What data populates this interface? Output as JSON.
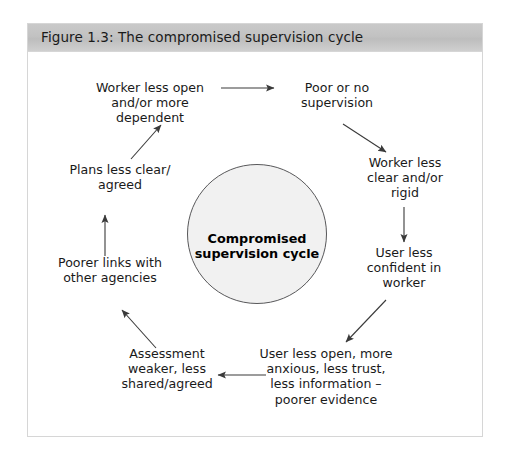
{
  "figure": {
    "title": "Figure 1.3: The compromised supervision cycle",
    "header_color": "#c4c4c4",
    "frame_border_color": "#d6d6d6",
    "background_color": "#ffffff"
  },
  "center": {
    "label": "Compromised\nsupervision cycle",
    "fill_color": "#f1f1f1",
    "border_color": "#58585a"
  },
  "nodes": [
    {
      "id": "worker-less-open",
      "label": "Worker less open\nand/or more\ndependent"
    },
    {
      "id": "poor-or-no-supervision",
      "label": "Poor or no\nsupervision"
    },
    {
      "id": "worker-less-clear",
      "label": "Worker less\nclear and/or\nrigid"
    },
    {
      "id": "user-less-confident",
      "label": "User less\nconfident in\nworker"
    },
    {
      "id": "user-less-open",
      "label": "User less open, more\nanxious, less trust,\nless information –\npoorer evidence"
    },
    {
      "id": "assessment-weaker",
      "label": "Assessment\nweaker, less\nshared/agreed"
    },
    {
      "id": "poorer-links",
      "label": "Poorer links with\nother agencies"
    },
    {
      "id": "plans-less-clear",
      "label": "Plans less clear/\nagreed"
    }
  ],
  "arrows": [
    {
      "id": "arrow-worker-open-to-poor-supervision",
      "from": "worker-less-open",
      "to": "poor-or-no-supervision"
    },
    {
      "id": "arrow-poor-supervision-to-worker-clear",
      "from": "poor-or-no-supervision",
      "to": "worker-less-clear"
    },
    {
      "id": "arrow-worker-clear-to-user-confident",
      "from": "worker-less-clear",
      "to": "user-less-confident"
    },
    {
      "id": "arrow-user-confident-to-user-open",
      "from": "user-less-confident",
      "to": "user-less-open"
    },
    {
      "id": "arrow-user-open-to-assessment",
      "from": "user-less-open",
      "to": "assessment-weaker"
    },
    {
      "id": "arrow-assessment-to-poorer-links",
      "from": "assessment-weaker",
      "to": "poorer-links"
    },
    {
      "id": "arrow-poorer-links-to-plans",
      "from": "poorer-links",
      "to": "plans-less-clear"
    },
    {
      "id": "arrow-plans-to-worker-open",
      "from": "plans-less-clear",
      "to": "worker-less-open"
    }
  ],
  "style": {
    "arrow_color": "#3a3a3a",
    "text_color": "#1a1a1a"
  }
}
